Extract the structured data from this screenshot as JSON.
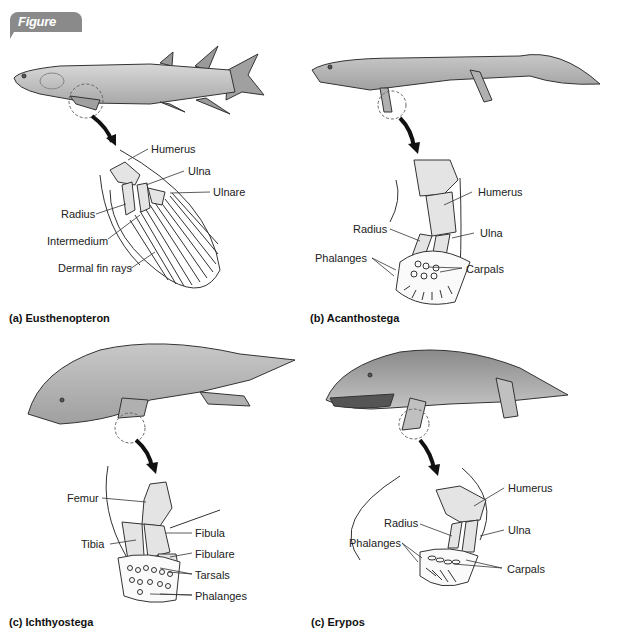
{
  "figure": {
    "badge": "Figure B.22"
  },
  "panels": [
    {
      "id": "a",
      "caption": "(a) Eusthenopteron",
      "labels": [
        "Humerus",
        "Ulna",
        "Ulnare",
        "Radius",
        "Intermedium",
        "Dermal fin rays"
      ]
    },
    {
      "id": "b",
      "caption": "(b) Acanthostega",
      "labels": [
        "Humerus",
        "Radius",
        "Ulna",
        "Phalanges",
        "Carpals"
      ]
    },
    {
      "id": "c",
      "caption": "(c) Ichthyostega",
      "labels": [
        "Femur",
        "Fibula",
        "Tibia",
        "Fibulare",
        "Tarsals",
        "Phalanges"
      ]
    },
    {
      "id": "d",
      "caption": "(c) Erypos",
      "labels": [
        "Humerus",
        "Radius",
        "Ulna",
        "Phalanges",
        "Carpals"
      ]
    }
  ],
  "colors": {
    "badge": "#8a8a8a",
    "body_fill": "#b8b8b8",
    "bone_fill": "#e4e4e4",
    "outline": "#333333",
    "arrow": "#111111"
  }
}
